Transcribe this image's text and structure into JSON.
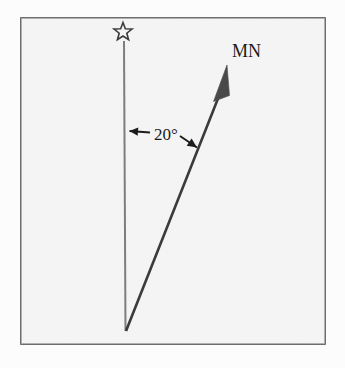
{
  "figure": {
    "name": "magnetic-north-declination-diagram",
    "caption": "Diagram showing a 20 degree angle between a vertical reference line topped by a star and an arrow labelled MN",
    "width": 345,
    "height": 368,
    "background_color": "#fcfcfc",
    "panel": {
      "fill_color": "#f5f5f5",
      "border_color": "#4a4a4a",
      "border_width": 1.6,
      "x": 21,
      "y": 18,
      "width": 304,
      "height": 326
    }
  },
  "elements": {
    "true_north_line": {
      "label": "true-north-line",
      "color": "#7d7d7d",
      "width": 2,
      "x1": 124,
      "y1": 41,
      "x2": 125.5,
      "y2": 331
    },
    "star": {
      "label": "star-marker",
      "semantic": "star-icon",
      "center_x": 123,
      "center_y": 32,
      "outer_radius": 9.5,
      "inner_radius": 4.0,
      "stroke_color": "#3c3c3c",
      "stroke_width": 1.6,
      "fill": "none"
    },
    "magnetic_north_arrow": {
      "label": "magnetic-north-arrow",
      "color": "#3a3a3a",
      "shaft_width": 2.6,
      "x1": 126,
      "y1": 331,
      "x2": 219,
      "y2": 96,
      "head_tip_x": 227,
      "head_tip_y": 65,
      "head_left_x": 213.5,
      "head_left_y": 101.5,
      "head_right_x": 229.5,
      "head_right_y": 95.5,
      "head_fill": "#4a4a4a"
    },
    "mn_label": {
      "label": "mn-label",
      "text": "MN",
      "x": 232,
      "y": 57,
      "font_size": 18,
      "color": "#1a1a1a"
    },
    "angle_annotation": {
      "label": "angle-annotation",
      "text": "20°",
      "value": 20,
      "unit": "degrees",
      "text_x": 166,
      "text_y": 140,
      "font_size": 17,
      "color": "#1a1a1a",
      "arrow_color": "#1c1c1c",
      "arrow_width": 1.9,
      "left_arrow": {
        "from_x": 150,
        "from_y": 132.5,
        "to_x": 129.5,
        "to_y": 131
      },
      "right_arrow": {
        "from_x": 180,
        "from_y": 136,
        "to_x": 197,
        "to_y": 147.5
      }
    }
  },
  "chart_data": {
    "type": "diagram",
    "annotations": [
      {
        "name": "star",
        "meaning": "true north / reference marker"
      },
      {
        "name": "MN",
        "meaning": "magnetic north arrow label"
      },
      {
        "name": "20°",
        "meaning": "angle between the reference line and the MN arrow"
      }
    ],
    "measured_angle_degrees": 20
  }
}
